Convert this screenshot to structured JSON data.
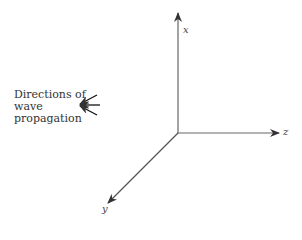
{
  "diagram": {
    "caption": "Directions of\nwave\npropagation",
    "axes": [
      {
        "name": "x",
        "label": "x"
      },
      {
        "name": "y",
        "label": "y"
      },
      {
        "name": "z",
        "label": "z"
      }
    ],
    "colors": {
      "axis": "#555555",
      "arrow": "#111111",
      "text": "#333333"
    }
  }
}
